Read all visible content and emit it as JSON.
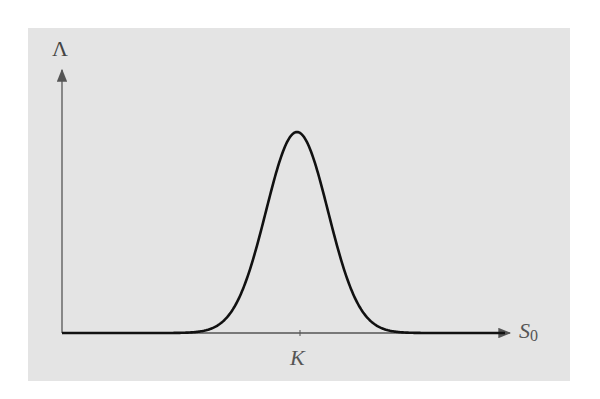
{
  "chart_data": {
    "type": "line",
    "title": "",
    "xlabel": "S0",
    "xlabel_main": "S",
    "xlabel_sub": "0",
    "ylabel": "Λ",
    "x_ticks": [
      "K"
    ],
    "grid": false,
    "legend": null,
    "series": [
      {
        "name": "Lambda",
        "x_relative_to_K": [
          -1.0,
          -0.6,
          -0.4,
          -0.3,
          -0.2,
          -0.1,
          0.0,
          0.1,
          0.2,
          0.3,
          0.4,
          0.6,
          1.0
        ],
        "y_relative": [
          0.0,
          0.01,
          0.08,
          0.2,
          0.45,
          0.82,
          1.0,
          0.82,
          0.45,
          0.2,
          0.08,
          0.01,
          0.0
        ]
      }
    ],
    "peak": {
      "x": "K",
      "y_relative": 1.0
    }
  },
  "labels": {
    "y_axis": "Λ",
    "x_axis_main": "S",
    "x_axis_sub": "0",
    "k_tick": "K"
  }
}
